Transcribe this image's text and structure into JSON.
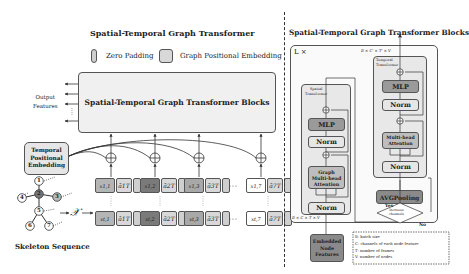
{
  "left_panel": {
    "title": "Spatial-Temporal Graph Transformer",
    "legend": [
      {
        "label": "Zero Padding",
        "swatch": "#cfcfcf"
      },
      {
        "label": "Graph Positional Embedding",
        "swatch": "#d8d8d8"
      }
    ],
    "main_block_label": "Spatial-Temporal Graph Transformer Blocks",
    "output_label": "Output\nFeatures",
    "output_line1": "Output",
    "output_line2": "Features",
    "temporal_embedding_line1": "Temporal",
    "temporal_embedding_line2": "Positional",
    "temporal_embedding_line3": "Embedding",
    "skeleton_label": "Skeleton Sequence",
    "x_symbol": "𝒳",
    "skeleton_nodes": [
      "1",
      "2",
      "3",
      "4",
      "5",
      "6",
      "7"
    ],
    "ellipsis": "···",
    "vdots": "⋮",
    "tokens_top": [
      {
        "x": "x1,1",
        "a": "ā1T",
        "color": "#b5b5b5"
      },
      {
        "x": "x1,2",
        "a": "ā2T",
        "color": "#7a7a7a"
      },
      {
        "x": "x1,3",
        "a": "ā3T",
        "color": "#a8a8a8"
      },
      {
        "x": "x1,7",
        "a": "ā7T",
        "color": "#ffffff"
      }
    ],
    "tokens_bottom": [
      {
        "x": "xt,1",
        "a": "ā1T",
        "color": "#b5b5b5"
      },
      {
        "x": "xt,2",
        "a": "ā2T",
        "color": "#7a7a7a"
      },
      {
        "x": "xt,3",
        "a": "ā3T",
        "color": "#a8a8a8"
      },
      {
        "x": "xt,7",
        "a": "ā7T",
        "color": "#ffffff"
      }
    ]
  },
  "right_panel": {
    "title": "Spatial-Temporal Graph Transformer Blocks",
    "repeat_label": "L ×",
    "top_dims": "B × C' × T' × V",
    "bottom_dims": "B × C × T × V",
    "spatial": {
      "title_line1": "Spatial",
      "title_line2": "Transformer",
      "mlp": "MLP",
      "norm_top": "Norm",
      "attention_line1": "Graph",
      "attention_line2": "Multi-head",
      "attention_line3": "Attention",
      "norm_bottom": "Norm"
    },
    "temporal": {
      "title_line1": "Temporal",
      "title_line2": "Transformer",
      "mlp": "MLP",
      "norm_top": "Norm",
      "attention_line1": "Multi-head",
      "attention_line2": "Attention",
      "norm_bottom": "Norm"
    },
    "avg_pooling": "AVGPooling",
    "decision_line1": "Increase",
    "decision_line2": "channels",
    "yes": "Yes",
    "no": "No",
    "input_line1": "Embedded",
    "input_line2": "Node",
    "input_line3": "Features",
    "legend": [
      "B: batch size",
      "C: channels of each node feature",
      "T: number of frames",
      "V: number of nodes"
    ]
  },
  "colors": {
    "panel_fill": "#f2f2f2",
    "block_fill": "#e6e6e6",
    "dark_box": "#8a8a8a",
    "mid_box": "#b8b8b8",
    "light_box": "#e8e8e8",
    "stroke": "#444444"
  }
}
